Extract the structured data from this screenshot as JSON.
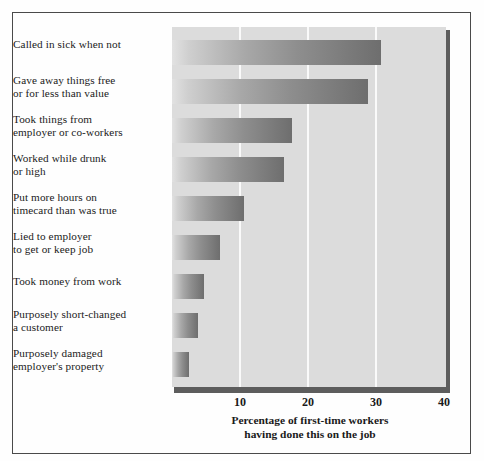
{
  "chart_data": {
    "type": "bar",
    "orientation": "horizontal",
    "title": "",
    "xlabel": "Percentage of first-time workers\nhaving done this on the job",
    "ylabel": "",
    "xlim": [
      0,
      40
    ],
    "xticks": [
      10,
      20,
      30,
      40
    ],
    "xtick_labels": [
      "10",
      "20",
      "30",
      "40"
    ],
    "grid": "vertical-gridlines-at-xticks",
    "legend": "none",
    "categories": [
      "Called in sick when not",
      "Gave away things free\nor for less than value",
      "Took things from\nemployer or co-workers",
      "Worked while drunk\nor high",
      "Put more hours on\ntimecard than was true",
      "Lied to employer\nto get or keep job",
      "Took money from work",
      "Purposely short-changed\na customer",
      "Purposely damaged\nemployer's property"
    ],
    "values": [
      31,
      29,
      17.8,
      16.6,
      10.7,
      7.1,
      4.7,
      3.8,
      2.5
    ],
    "bar_style": "horizontal gradient light-left to dark-right",
    "plot_background": "#dcdcdc",
    "gridline_color": "#fafafa",
    "shadow_color": "#5d5d5d",
    "frame_color": "#4a4a4a"
  }
}
